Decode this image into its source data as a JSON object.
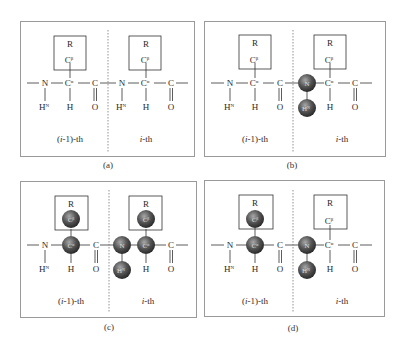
{
  "figure": {
    "panels": [
      {
        "id": "a",
        "caption": "(a)",
        "left_label": "(i-1)-th",
        "right_label": "i-th",
        "highlighted": []
      },
      {
        "id": "b",
        "caption": "(b)",
        "left_label": "(i-1)-th",
        "right_label": "i-th",
        "highlighted": [
          "N_i",
          "HN_i"
        ]
      },
      {
        "id": "c",
        "caption": "(c)",
        "left_label": "(i-1)-th",
        "right_label": "i-th",
        "highlighted": [
          "CB_i-1",
          "CA_i-1",
          "N_i",
          "HN_i",
          "CA_i",
          "CB_i"
        ]
      },
      {
        "id": "d",
        "caption": "(d)",
        "left_label": "(i-1)-th",
        "right_label": "i-th",
        "highlighted": [
          "CB_i-1",
          "CA_i-1",
          "N_i",
          "HN_i"
        ]
      }
    ],
    "atoms": {
      "side_chain": "R",
      "c_beta": "C",
      "c_beta_sup": "β",
      "n": "N",
      "c_alpha": "C",
      "c_alpha_sup": "α",
      "c": "C",
      "h_n": "H",
      "h_n_sup": "N",
      "h": "H",
      "o": "O"
    },
    "colors": {
      "frame": "#9a9a9a",
      "sphere_dark": "#3a3a3a",
      "sphere_light": "#9a9a9a",
      "text": "#2a2a2a"
    }
  }
}
